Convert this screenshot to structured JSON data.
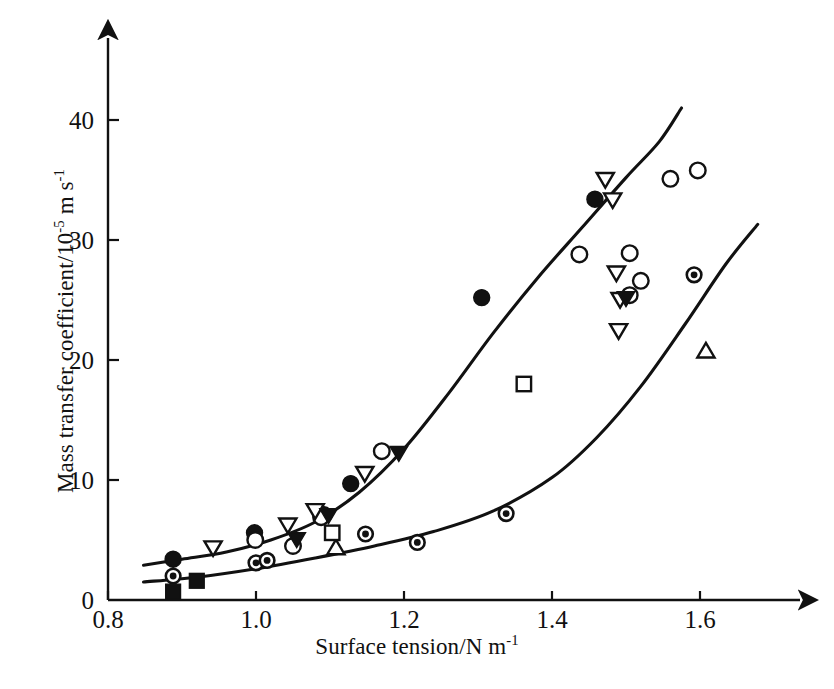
{
  "chart_data": {
    "type": "scatter",
    "title": "",
    "xlabel": "Surface tension/N m",
    "xlabel_sup": "-1",
    "ylabel": "Mass transfer coefficient/10",
    "ylabel_sup1": "-5",
    "ylabel_mid": " m s",
    "ylabel_sup2": "-1",
    "xlim": [
      0.8,
      1.73
    ],
    "ylim": [
      0,
      45.5
    ],
    "xticks": [
      0.8,
      1.0,
      1.2,
      1.4,
      1.6
    ],
    "xticklabels": [
      "0.8",
      "1.0",
      "1.2",
      "1.4",
      "1.6"
    ],
    "yticks": [
      0,
      10,
      20,
      30,
      40
    ],
    "yticklabels": [
      "0",
      "10",
      "20",
      "30",
      "40"
    ],
    "grid": false,
    "legend": "none",
    "axis_style": "arrow-terminated L-axes",
    "series": [
      {
        "name": "filled-circle",
        "marker": "filled-circle",
        "points": [
          {
            "x": 0.888,
            "y": 3.4
          },
          {
            "x": 0.998,
            "y": 5.6
          },
          {
            "x": 1.092,
            "y": 7.1
          },
          {
            "x": 1.128,
            "y": 9.7
          },
          {
            "x": 1.305,
            "y": 25.2
          },
          {
            "x": 1.458,
            "y": 33.4
          }
        ]
      },
      {
        "name": "open-circle",
        "marker": "open-circle",
        "points": [
          {
            "x": 0.999,
            "y": 5.0
          },
          {
            "x": 1.05,
            "y": 4.5
          },
          {
            "x": 1.088,
            "y": 6.9
          },
          {
            "x": 1.17,
            "y": 12.4
          },
          {
            "x": 1.437,
            "y": 28.8
          },
          {
            "x": 1.505,
            "y": 28.9
          },
          {
            "x": 1.52,
            "y": 26.6
          },
          {
            "x": 1.505,
            "y": 25.4
          },
          {
            "x": 1.56,
            "y": 35.1
          },
          {
            "x": 1.597,
            "y": 35.8
          }
        ]
      },
      {
        "name": "open-down-triangle",
        "marker": "open-down-triangle",
        "points": [
          {
            "x": 0.942,
            "y": 4.3
          },
          {
            "x": 1.043,
            "y": 6.2
          },
          {
            "x": 1.08,
            "y": 7.4
          },
          {
            "x": 1.147,
            "y": 10.5
          },
          {
            "x": 1.472,
            "y": 35.0
          },
          {
            "x": 1.482,
            "y": 33.3
          },
          {
            "x": 1.487,
            "y": 27.2
          },
          {
            "x": 1.492,
            "y": 25.0
          },
          {
            "x": 1.49,
            "y": 22.4
          }
        ]
      },
      {
        "name": "filled-down-triangle",
        "marker": "filled-down-triangle",
        "points": [
          {
            "x": 1.055,
            "y": 5.0
          },
          {
            "x": 1.098,
            "y": 7.0
          },
          {
            "x": 1.193,
            "y": 12.2
          },
          {
            "x": 1.5,
            "y": 25.1
          }
        ]
      },
      {
        "name": "open-up-triangle",
        "marker": "open-up-triangle",
        "points": [
          {
            "x": 1.108,
            "y": 4.4
          },
          {
            "x": 1.608,
            "y": 20.8
          }
        ]
      },
      {
        "name": "open-square",
        "marker": "open-square",
        "points": [
          {
            "x": 1.103,
            "y": 5.6
          },
          {
            "x": 1.362,
            "y": 18.0
          }
        ]
      },
      {
        "name": "circled-dot",
        "marker": "circled-dot",
        "points": [
          {
            "x": 0.888,
            "y": 2.0
          },
          {
            "x": 1.0,
            "y": 3.1
          },
          {
            "x": 1.015,
            "y": 3.3
          },
          {
            "x": 1.148,
            "y": 5.5
          },
          {
            "x": 1.218,
            "y": 4.8
          },
          {
            "x": 1.338,
            "y": 7.2
          },
          {
            "x": 1.592,
            "y": 27.1
          }
        ]
      },
      {
        "name": "filled-square",
        "marker": "filled-square",
        "points": [
          {
            "x": 0.888,
            "y": 0.7
          },
          {
            "x": 0.92,
            "y": 1.6
          }
        ]
      }
    ],
    "curves": [
      {
        "name": "upper-trend-curve",
        "points": [
          {
            "x": 0.848,
            "y": 2.9
          },
          {
            "x": 0.9,
            "y": 3.4
          },
          {
            "x": 0.96,
            "y": 4.0
          },
          {
            "x": 1.02,
            "y": 5.0
          },
          {
            "x": 1.08,
            "y": 6.5
          },
          {
            "x": 1.14,
            "y": 9.0
          },
          {
            "x": 1.2,
            "y": 12.6
          },
          {
            "x": 1.26,
            "y": 17.2
          },
          {
            "x": 1.32,
            "y": 22.2
          },
          {
            "x": 1.38,
            "y": 26.8
          },
          {
            "x": 1.44,
            "y": 31.0
          },
          {
            "x": 1.5,
            "y": 35.2
          },
          {
            "x": 1.545,
            "y": 38.2
          },
          {
            "x": 1.575,
            "y": 41.0
          }
        ]
      },
      {
        "name": "lower-trend-curve",
        "points": [
          {
            "x": 0.848,
            "y": 1.5
          },
          {
            "x": 0.92,
            "y": 1.9
          },
          {
            "x": 1.0,
            "y": 2.6
          },
          {
            "x": 1.08,
            "y": 3.5
          },
          {
            "x": 1.16,
            "y": 4.5
          },
          {
            "x": 1.24,
            "y": 5.7
          },
          {
            "x": 1.32,
            "y": 7.4
          },
          {
            "x": 1.4,
            "y": 10.2
          },
          {
            "x": 1.46,
            "y": 13.5
          },
          {
            "x": 1.52,
            "y": 17.8
          },
          {
            "x": 1.58,
            "y": 23.0
          },
          {
            "x": 1.635,
            "y": 28.0
          },
          {
            "x": 1.678,
            "y": 31.3
          }
        ]
      }
    ]
  }
}
